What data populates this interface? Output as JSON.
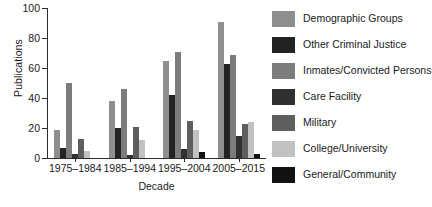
{
  "chart_data": {
    "type": "bar",
    "title": "",
    "xlabel": "Decade",
    "ylabel": "Publications",
    "ylim": [
      0,
      100
    ],
    "yticks": [
      0,
      20,
      40,
      60,
      80,
      100
    ],
    "grid": false,
    "legend_position": "right",
    "categories": [
      "1975–1984",
      "1985–1994",
      "1995–2004",
      "2005–2015"
    ],
    "series": [
      {
        "name": "Demographic Groups",
        "color": "#8f8f8f",
        "values": [
          19,
          38,
          65,
          91
        ]
      },
      {
        "name": "Other Criminal Justice",
        "color": "#232323",
        "values": [
          7,
          20,
          42,
          63
        ]
      },
      {
        "name": "Inmates/Convicted Persons",
        "color": "#7c7c7c",
        "values": [
          50,
          46,
          71,
          69
        ]
      },
      {
        "name": "Care Facility",
        "color": "#303030",
        "values": [
          3,
          2,
          6,
          15
        ]
      },
      {
        "name": "Military",
        "color": "#5e5e5e",
        "values": [
          13,
          21,
          25,
          23
        ]
      },
      {
        "name": "College/University",
        "color": "#c2c2c2",
        "values": [
          5,
          12,
          19,
          24
        ]
      },
      {
        "name": "General/Community",
        "color": "#121212",
        "values": [
          0,
          0,
          4,
          3
        ]
      }
    ]
  },
  "legend": {
    "items": [
      {
        "label": "Demographic Groups"
      },
      {
        "label": "Other Criminal Justice"
      },
      {
        "label": "Inmates/Convicted Persons"
      },
      {
        "label": "Care Facility"
      },
      {
        "label": "Military"
      },
      {
        "label": "College/University"
      },
      {
        "label": "General/Community"
      }
    ]
  }
}
